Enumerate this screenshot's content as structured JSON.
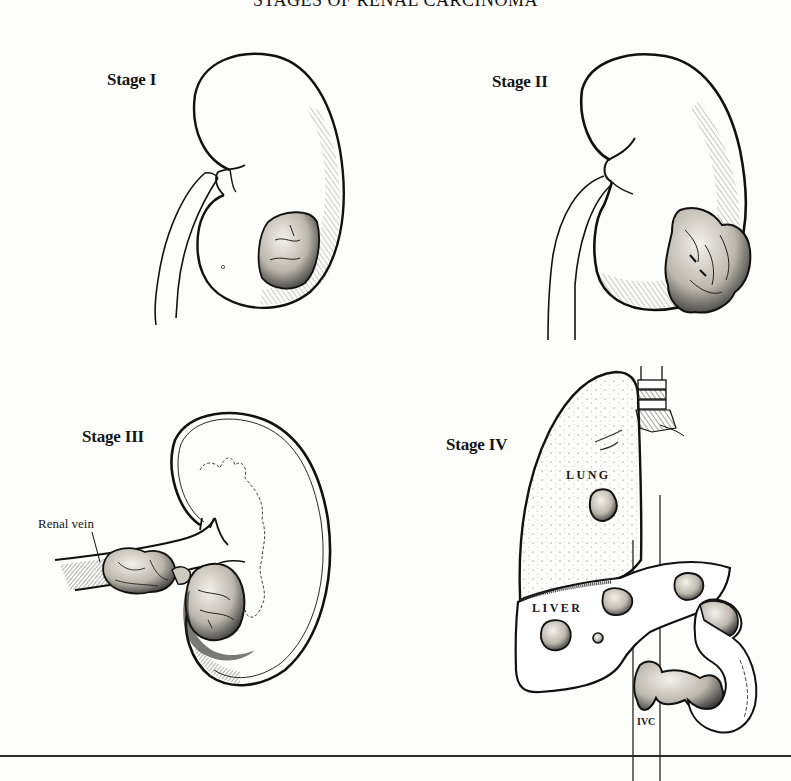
{
  "figure": {
    "title": "STAGES OF RENAL CARCINOMA",
    "panels": [
      {
        "id": "stage-1",
        "label": "Stage I",
        "description": "Kidney with small tumor confined within the renal capsule"
      },
      {
        "id": "stage-2",
        "label": "Stage II",
        "description": "Kidney with larger tumor extending beyond the capsule"
      },
      {
        "id": "stage-3",
        "label": "Stage III",
        "description": "Tumor extending into the renal vein",
        "annotations": [
          "Renal vein"
        ]
      },
      {
        "id": "stage-4",
        "label": "Stage IV",
        "description": "Distant metastases to lung and liver, tumor thrombus into IVC",
        "annotations": [
          "LUNG",
          "LIVER",
          "IVC"
        ]
      }
    ]
  },
  "colors": {
    "ink": "#111111",
    "paper": "#fdfdfb",
    "tumor_fill": "#d9d6cf",
    "hatch": "#333333"
  }
}
